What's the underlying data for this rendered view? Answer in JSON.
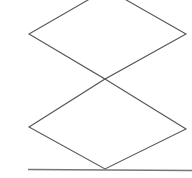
{
  "figure": {
    "type": "line-drawing",
    "canvas": {
      "width": 192,
      "height": 178,
      "background_color": "#ffffff"
    },
    "style": {
      "stroke_color": "#555555",
      "stroke_color_light": "#777777",
      "stroke_width": 1.1,
      "baseline_stroke_width": 1.3
    },
    "shapes": [
      {
        "name": "upper-rhombus",
        "label": "Upper rhombus",
        "closed": true,
        "clipped_at_top": true,
        "points": "107,-11 186,34 105,79 29,34",
        "vertices": [
          {
            "name": "top",
            "x": 107,
            "y": -11
          },
          {
            "name": "right",
            "x": 186,
            "y": 34
          },
          {
            "name": "bottom",
            "x": 105,
            "y": 79
          },
          {
            "name": "left",
            "x": 29,
            "y": 34
          }
        ]
      },
      {
        "name": "lower-rhombus",
        "label": "Lower rhombus",
        "closed": true,
        "clipped_at_top": false,
        "points": "105,79 186,129 105,169 29,127",
        "vertices": [
          {
            "name": "top",
            "x": 105,
            "y": 79
          },
          {
            "name": "right",
            "x": 186,
            "y": 129
          },
          {
            "name": "bottom",
            "x": 105,
            "y": 169
          },
          {
            "name": "left",
            "x": 29,
            "y": 127
          }
        ]
      }
    ],
    "lines": [
      {
        "name": "baseline",
        "label": "Horizontal baseline",
        "x1": 28,
        "y1": 169.5,
        "x2": 192,
        "y2": 170.5
      }
    ],
    "intersection_points": [
      {
        "name": "rhombi-crossing",
        "x": 105,
        "y": 79
      },
      {
        "name": "baseline-apex-contact",
        "x": 105,
        "y": 169
      }
    ]
  }
}
